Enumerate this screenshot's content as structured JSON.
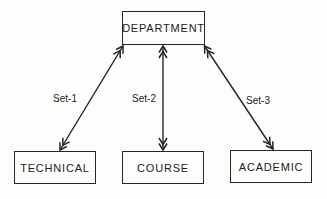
{
  "diagram": {
    "type": "network-data-model",
    "background_color": "#fdfdfc",
    "ink_color": "#242424",
    "nodes": {
      "department": {
        "label": "DEPARTMENT",
        "position": "top-center"
      },
      "technical": {
        "label": "TECHNICAL",
        "position": "bottom-left"
      },
      "course": {
        "label": "COURSE",
        "position": "bottom-center"
      },
      "academic": {
        "label": "ACADEMIC",
        "position": "bottom-right"
      }
    },
    "edges": [
      {
        "from": "DEPARTMENT",
        "to": "TECHNICAL",
        "label": "Set-1",
        "style": "double-chevron-arrowheads-both-ends"
      },
      {
        "from": "DEPARTMENT",
        "to": "COURSE",
        "label": "Set-2",
        "style": "double-chevron-arrowheads-both-ends"
      },
      {
        "from": "DEPARTMENT",
        "to": "ACADEMIC",
        "label": "Set-3",
        "style": "double-chevron-arrowheads-both-ends"
      }
    ]
  }
}
